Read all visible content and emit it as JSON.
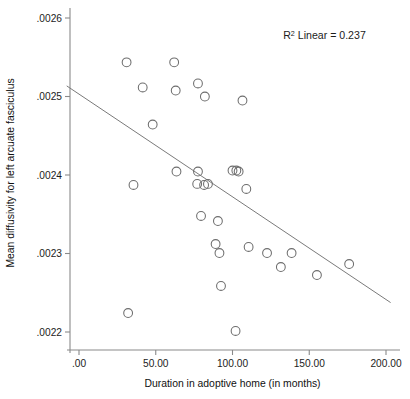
{
  "chart_data": {
    "type": "scatter",
    "title": "",
    "xlabel": "Duration in adoptive home (in months)",
    "ylabel": "Mean diffusivity for left arcuate fasciculus",
    "xlim": [
      -8,
      208
    ],
    "ylim": [
      0.00215,
      0.00264
    ],
    "grid": false,
    "legend": null,
    "annotations": [
      {
        "text_prefix": "R",
        "text_sup": "2",
        "text_suffix": " Linear = 0.237",
        "x": 133,
        "y": 0.002573
      }
    ],
    "xticks": [
      0,
      50,
      100,
      150,
      200
    ],
    "xticklabels": [
      ".00",
      "50.00",
      "100.00",
      "150.00",
      "200.00"
    ],
    "yticks": [
      0.0022,
      0.0023,
      0.0024,
      0.0025,
      0.0026
    ],
    "yticklabels": [
      ".0022",
      ".0023",
      ".0024",
      ".0025",
      ".0026"
    ],
    "marker_style": "open-circle",
    "marker_size_px": 4.4,
    "point_color": "#6d6d6d",
    "line_color": "#7a7a7a",
    "axis_color": "#8a8a8a",
    "points": [
      {
        "x": 31.0,
        "y": 0.0025435
      },
      {
        "x": 41.5,
        "y": 0.0025115
      },
      {
        "x": 62.0,
        "y": 0.0025435
      },
      {
        "x": 63.0,
        "y": 0.0025076
      },
      {
        "x": 77.5,
        "y": 0.0025166
      },
      {
        "x": 82.0,
        "y": 0.0025
      },
      {
        "x": 106.5,
        "y": 0.0024949
      },
      {
        "x": 48.0,
        "y": 0.0024643
      },
      {
        "x": 63.5,
        "y": 0.0024044
      },
      {
        "x": 35.5,
        "y": 0.0023873
      },
      {
        "x": 77.5,
        "y": 0.0024044
      },
      {
        "x": 77.0,
        "y": 0.0023886
      },
      {
        "x": 81.5,
        "y": 0.0023873
      },
      {
        "x": 84.0,
        "y": 0.0023886
      },
      {
        "x": 100.0,
        "y": 0.0024057
      },
      {
        "x": 102.5,
        "y": 0.0024057
      },
      {
        "x": 104.0,
        "y": 0.0024044
      },
      {
        "x": 109.0,
        "y": 0.0023822
      },
      {
        "x": 79.5,
        "y": 0.0023478
      },
      {
        "x": 90.5,
        "y": 0.0023414
      },
      {
        "x": 89.0,
        "y": 0.0023121
      },
      {
        "x": 91.5,
        "y": 0.0023006
      },
      {
        "x": 110.5,
        "y": 0.0023083
      },
      {
        "x": 122.5,
        "y": 0.0023006
      },
      {
        "x": 138.5,
        "y": 0.0023006
      },
      {
        "x": 131.5,
        "y": 0.0022828
      },
      {
        "x": 176.0,
        "y": 0.0022866
      },
      {
        "x": 155.0,
        "y": 0.0022726
      },
      {
        "x": 92.5,
        "y": 0.0022586
      },
      {
        "x": 32.0,
        "y": 0.0022242
      },
      {
        "x": 102.0,
        "y": 0.0022013
      }
    ],
    "fit_line": {
      "x_start": -8,
      "y_start": 0.0025135,
      "x_end": 203,
      "y_end": 0.0022375
    }
  }
}
